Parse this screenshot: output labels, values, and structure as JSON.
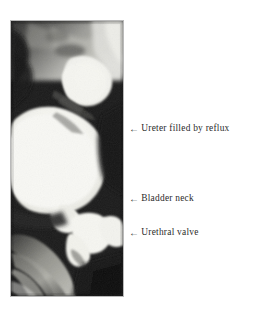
{
  "figure": {
    "kind": "radiograph-annotated-figure",
    "background_color": "#ffffff"
  },
  "radiograph": {
    "name": "voiding-cystourethrogram",
    "border_color": "#b9b9b9",
    "frame": {
      "x": 10,
      "y": 20,
      "width": 114,
      "height": 277
    },
    "tones": {
      "contrast_bright": "#f7f7f3",
      "soft_tissue_mid": "#8d8d8d",
      "dark_background": "#1d1d1d",
      "bone_gray": "#b5b5ad"
    },
    "regions": [
      {
        "name": "ureter-reflux-contrast",
        "tone": "contrast_bright"
      },
      {
        "name": "bladder-contrast",
        "tone": "contrast_bright"
      },
      {
        "name": "bladder-neck",
        "tone": "contrast_bright"
      },
      {
        "name": "posterior-urethra-valve",
        "tone": "contrast_bright"
      },
      {
        "name": "pelvic-bone",
        "tone": "bone_gray"
      },
      {
        "name": "femur-shaft",
        "tone": "bone_gray"
      }
    ]
  },
  "annotations": {
    "arrow_glyph": "←",
    "items": [
      {
        "id": "ureter",
        "label": "Ureter filled by reflux",
        "arrow": "←"
      },
      {
        "id": "bladder-neck",
        "label": "Bladder neck",
        "arrow": "←"
      },
      {
        "id": "urethral-valve",
        "label": "Urethral valve",
        "arrow": "←"
      }
    ]
  }
}
